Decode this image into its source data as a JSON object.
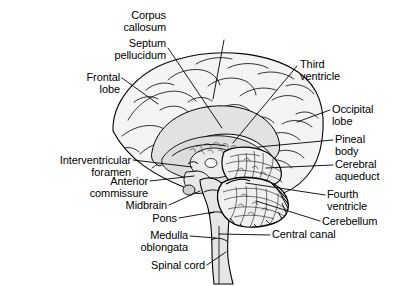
{
  "figure": {
    "type": "anatomical-diagram",
    "background_color": "#ffffff",
    "line_color": "#000000",
    "fill_light": "#f2f2f2",
    "fill_mid": "#d9d9d9",
    "fill_dark": "#bdbdbd",
    "text_color": "#000000"
  },
  "labels": [
    {
      "id": "corpus-callosum",
      "text": "Corpus\ncallosum",
      "align": "center",
      "x": 224,
      "y": 10,
      "leader": [
        [
          224,
          40
        ],
        [
          213,
          99
        ]
      ]
    },
    {
      "id": "septum-pellucidum",
      "text": "Septum\npellucidum",
      "align": "right",
      "x": 166,
      "y": 38,
      "leader": [
        [
          168,
          48
        ],
        [
          222,
          128
        ]
      ]
    },
    {
      "id": "frontal-lobe",
      "text": "Frontal\nlobe",
      "align": "right",
      "x": 120,
      "y": 72,
      "leader": [
        [
          122,
          78
        ],
        [
          158,
          104
        ]
      ]
    },
    {
      "id": "third-ventricle",
      "text": "Third\nventricle",
      "align": "left",
      "x": 300,
      "y": 59,
      "leader": [
        [
          297,
          66
        ],
        [
          233,
          143
        ]
      ]
    },
    {
      "id": "occipital-lobe",
      "text": "Occipital\nlobe",
      "align": "left",
      "x": 332,
      "y": 104,
      "leader": [
        [
          330,
          110
        ],
        [
          297,
          122
        ]
      ]
    },
    {
      "id": "pineal-body",
      "text": "Pineal\nbody",
      "align": "left",
      "x": 335,
      "y": 134,
      "leader": [
        [
          333,
          140
        ],
        [
          258,
          147
        ]
      ]
    },
    {
      "id": "cerebral-aqueduct",
      "text": "Cerebral\naqueduct",
      "align": "left",
      "x": 335,
      "y": 159,
      "leader": [
        [
          333,
          165
        ],
        [
          266,
          168
        ]
      ]
    },
    {
      "id": "fourth-ventricle",
      "text": "Fourth\nventricle",
      "align": "left",
      "x": 327,
      "y": 189,
      "leader": [
        [
          325,
          195
        ],
        [
          246,
          183
        ]
      ]
    },
    {
      "id": "cerebellum",
      "text": "Cerebellum",
      "align": "left",
      "x": 322,
      "y": 218,
      "leader": [
        [
          320,
          221
        ],
        [
          256,
          201
        ]
      ]
    },
    {
      "id": "central-canal",
      "text": "Central canal",
      "align": "left",
      "x": 272,
      "y": 231,
      "leader": [
        [
          270,
          235
        ],
        [
          219,
          234
        ]
      ]
    },
    {
      "id": "interventricular-foramen",
      "text": "Interventricular\nforamen",
      "align": "right",
      "x": 131,
      "y": 155,
      "leader": [
        [
          133,
          160
        ],
        [
          192,
          167
        ]
      ]
    },
    {
      "id": "anterior-commissure",
      "text": "Anterior\ncommissure",
      "align": "right",
      "x": 148,
      "y": 176,
      "leader": [
        [
          150,
          181
        ],
        [
          194,
          176
        ]
      ]
    },
    {
      "id": "midbrain",
      "text": "Midbrain",
      "align": "right",
      "x": 167,
      "y": 201,
      "leader": [
        [
          169,
          205
        ],
        [
          200,
          191
        ]
      ]
    },
    {
      "id": "pons",
      "text": "Pons",
      "align": "right",
      "x": 177,
      "y": 214,
      "leader": [
        [
          179,
          218
        ],
        [
          214,
          212
        ]
      ]
    },
    {
      "id": "medulla-oblongata",
      "text": "Medulla\noblongata",
      "align": "right",
      "x": 188,
      "y": 231,
      "leader": [
        [
          190,
          236
        ],
        [
          216,
          238
        ]
      ]
    },
    {
      "id": "spinal-cord",
      "text": "Spinal cord",
      "align": "right",
      "x": 205,
      "y": 261,
      "leader": [
        [
          207,
          265
        ],
        [
          226,
          252
        ]
      ]
    }
  ]
}
